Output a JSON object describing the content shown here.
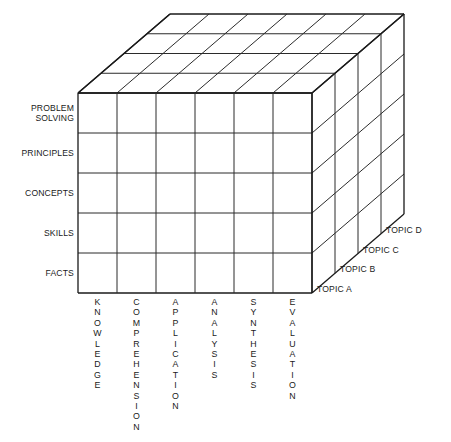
{
  "figure": {
    "background_color": "#ffffff",
    "line_color": "#2b2b2b"
  },
  "axes": {
    "vertical_axis_name": "content-types",
    "horizontal_axis_name": "cognitive-levels",
    "depth_axis_name": "topics"
  },
  "rows": [
    {
      "label": "PROBLEM SOLVING",
      "lines": [
        "PROBLEM",
        "SOLVING"
      ]
    },
    {
      "label": "PRINCIPLES",
      "lines": [
        "PRINCIPLES"
      ]
    },
    {
      "label": "CONCEPTS",
      "lines": [
        "CONCEPTS"
      ]
    },
    {
      "label": "SKILLS",
      "lines": [
        "SKILLS"
      ]
    },
    {
      "label": "FACTS",
      "lines": [
        "FACTS"
      ]
    }
  ],
  "columns": [
    {
      "label": "KNOWLEDGE",
      "letters": [
        "K",
        "N",
        "O",
        "W",
        "L",
        "E",
        "D",
        "G",
        "E"
      ]
    },
    {
      "label": "COMPREHENSION",
      "letters": [
        "C",
        "O",
        "M",
        "P",
        "R",
        "E",
        "H",
        "E",
        "N",
        "S",
        "I",
        "O",
        "N"
      ]
    },
    {
      "label": "APPLICATION",
      "letters": [
        "A",
        "P",
        "P",
        "L",
        "I",
        "C",
        "A",
        "T",
        "I",
        "O",
        "N"
      ]
    },
    {
      "label": "ANALYSIS",
      "letters": [
        "A",
        "N",
        "A",
        "L",
        "Y",
        "S",
        "I",
        "S"
      ]
    },
    {
      "label": "SYNTHESIS",
      "letters": [
        "S",
        "Y",
        "N",
        "T",
        "H",
        "E",
        "S",
        "I",
        "S"
      ]
    },
    {
      "label": "EVALUATION",
      "letters": [
        "E",
        "V",
        "A",
        "L",
        "U",
        "A",
        "T",
        "I",
        "O",
        "N"
      ]
    }
  ],
  "topics": [
    {
      "label": "TOPIC A"
    },
    {
      "label": "TOPIC B"
    },
    {
      "label": "TOPIC C"
    },
    {
      "label": "TOPIC D"
    }
  ],
  "chart_data": {
    "type": "table",
    "title": "",
    "xlabel": "",
    "ylabel": "",
    "dimensions": {
      "columns": 6,
      "rows": 5,
      "depth": 4
    },
    "categories": [
      "KNOWLEDGE",
      "COMPREHENSION",
      "APPLICATION",
      "ANALYSIS",
      "SYNTHESIS",
      "EVALUATION"
    ],
    "row_categories": [
      "PROBLEM SOLVING",
      "PRINCIPLES",
      "CONCEPTS",
      "SKILLS",
      "FACTS"
    ],
    "depth_categories": [
      "TOPIC A",
      "TOPIC B",
      "TOPIC C",
      "TOPIC D"
    ]
  }
}
